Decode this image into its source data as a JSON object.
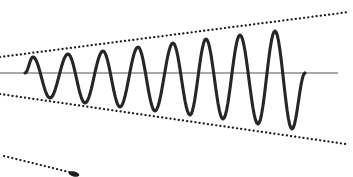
{
  "figure": {
    "title": "Divergent oscillation with exponentially growing amplitude",
    "background_color": "#ffffff",
    "width": 353,
    "height": 177
  },
  "colors": {
    "wave": "#262626",
    "axis": "#8c8c8c",
    "envelope": "#1a1a1a",
    "marker": "#1f1f1f",
    "background": "#ffffff"
  },
  "chart_data": {
    "type": "line",
    "title": "Divergent oscillation with exponentially growing amplitude",
    "xlabel": "",
    "ylabel": "",
    "xlim": [
      0,
      353
    ],
    "ylim": [
      177,
      0
    ],
    "grid": false,
    "legend": null,
    "baseline_y": 73,
    "axis": {
      "name": "zero-axis",
      "x_start": 0,
      "x_end": 338,
      "y": 73,
      "color": "#8c8c8c",
      "width": 1.6,
      "style": "solid"
    },
    "series": [
      {
        "name": "oscillation",
        "style": "solid",
        "color": "#262626",
        "width": 3.1,
        "x_start": 25,
        "x_end": 305,
        "half_period": 17.4,
        "peaks": [
          {
            "x": 33,
            "y": 57,
            "amplitude": 16
          },
          {
            "x": 68,
            "y": 54,
            "amplitude": 19
          },
          {
            "x": 103,
            "y": 51,
            "amplitude": 22
          },
          {
            "x": 138,
            "y": 47,
            "amplitude": 26
          },
          {
            "x": 173,
            "y": 43,
            "amplitude": 30
          },
          {
            "x": 206,
            "y": 39,
            "amplitude": 34
          },
          {
            "x": 240,
            "y": 35,
            "amplitude": 38
          },
          {
            "x": 275,
            "y": 31,
            "amplitude": 42
          }
        ],
        "troughs": [
          {
            "x": 50,
            "y": 98,
            "amplitude": 25
          },
          {
            "x": 85,
            "y": 103,
            "amplitude": 30
          },
          {
            "x": 120,
            "y": 107,
            "amplitude": 34
          },
          {
            "x": 155,
            "y": 111,
            "amplitude": 38
          },
          {
            "x": 190,
            "y": 115,
            "amplitude": 42
          },
          {
            "x": 223,
            "y": 119,
            "amplitude": 46
          },
          {
            "x": 258,
            "y": 124,
            "amplitude": 51
          },
          {
            "x": 292,
            "y": 129,
            "amplitude": 56
          }
        ]
      }
    ],
    "envelopes": [
      {
        "name": "upper-envelope",
        "style": "dotted",
        "color": "#1a1a1a",
        "width": 2.2,
        "x_start": 0,
        "y_start": 57,
        "x_end": 349,
        "y_end": 12,
        "slope": -0.129
      },
      {
        "name": "lower-envelope",
        "style": "dotted",
        "color": "#1a1a1a",
        "width": 2.2,
        "x_start": 0,
        "y_start": 94,
        "x_end": 346,
        "y_end": 144,
        "slope": 0.145
      },
      {
        "name": "secondary-lower-envelope",
        "style": "dotted",
        "color": "#1a1a1a",
        "width": 2.2,
        "x_start": 4,
        "y_start": 156,
        "x_end": 73,
        "y_end": 173,
        "slope": 0.246
      }
    ],
    "annotations": [
      {
        "name": "endpoint-marker",
        "shape": "blob",
        "x": 74,
        "y": 174,
        "width": 11,
        "height": 5,
        "color": "#1f1f1f"
      }
    ]
  }
}
